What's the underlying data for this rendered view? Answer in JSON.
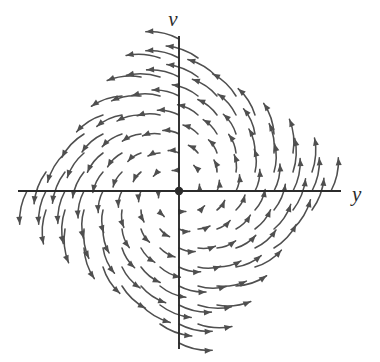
{
  "figure": {
    "name": "phase-portrait-direction-field",
    "title": "",
    "background_color": "#ffffff",
    "axis_color": "#2b2b2b",
    "arrow_color": "#4f4f4f",
    "origin_dot_color": "#2b2b2b"
  },
  "axes": {
    "horizontal": {
      "label": "y",
      "label_x": 352,
      "label_y": 201,
      "x_start": 18,
      "x_end": 341,
      "y": 191
    },
    "vertical": {
      "label": "v",
      "label_x": 173,
      "label_y": 26,
      "y_start": 36,
      "y_end": 349,
      "x": 179
    },
    "origin": {
      "x": 179,
      "y": 191,
      "dot_radius": 4.2
    }
  },
  "chart_data": {
    "type": "scatter",
    "title": "",
    "xlabel": "y",
    "ylabel": "v",
    "grid": false,
    "legend": false,
    "xlim": [
      -8.5,
      8.5
    ],
    "ylim": [
      -8.5,
      8.5
    ],
    "origin": [
      0,
      0
    ],
    "rotation": "counterclockwise",
    "spiral_outward": true,
    "grid_spacing": 1,
    "grid_extent": 8,
    "boundary_shape": "diamond",
    "boundary_radius": 8,
    "field_model": {
      "dy_dt": "a*y + b*v",
      "dv_dt": "c*y + d*v",
      "a": 0.22,
      "b": -1.0,
      "c": 1.0,
      "d": 0.22
    },
    "pixels_per_unit": 19.0,
    "arrow_scale_px_per_unit": 5.4,
    "arrow_max_length_px": 34,
    "arrow_head_length_px": 7.5,
    "arrow_head_width_px": 6.0,
    "curvature": 0.28
  }
}
